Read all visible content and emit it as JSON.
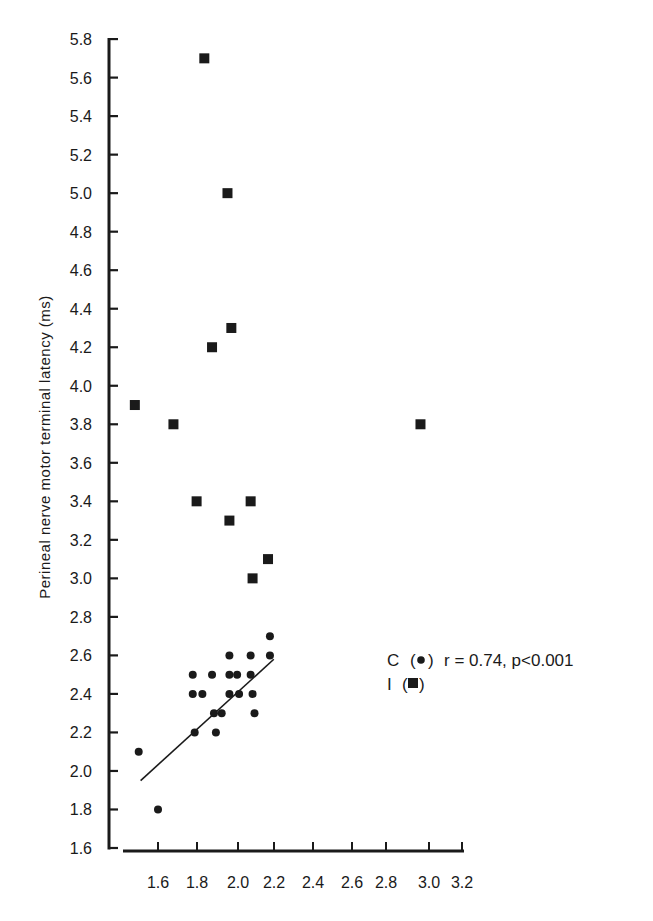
{
  "chart_data": {
    "type": "scatter",
    "title": "",
    "xlabel": "",
    "ylabel": "Perineal nerve motor terminal latency (ms)",
    "xlim": [
      1.5,
      3.2
    ],
    "ylim": [
      1.6,
      5.8
    ],
    "x_ticks": [
      "1.6",
      "1.8",
      "2.0",
      "2.2",
      "2.4",
      "2.6",
      "2.8",
      "3.0",
      "3.2"
    ],
    "y_ticks": [
      "1.6",
      "1.8",
      "2.0",
      "2.2",
      "2.4",
      "2.6",
      "2.8",
      "3.0",
      "3.2",
      "3.4",
      "3.6",
      "3.8",
      "4.0",
      "4.2",
      "4.4",
      "4.6",
      "4.8",
      "5.0",
      "5.2",
      "5.4",
      "5.6",
      "5.8"
    ],
    "grid": false,
    "series": [
      {
        "name": "C",
        "marker": "circle",
        "points": [
          [
            1.5,
            2.1
          ],
          [
            1.6,
            1.8
          ],
          [
            1.78,
            2.5
          ],
          [
            1.78,
            2.4
          ],
          [
            1.83,
            2.4
          ],
          [
            1.79,
            2.2
          ],
          [
            1.88,
            2.5
          ],
          [
            1.89,
            2.3
          ],
          [
            1.93,
            2.3
          ],
          [
            1.9,
            2.2
          ],
          [
            1.97,
            2.6
          ],
          [
            1.97,
            2.5
          ],
          [
            2.01,
            2.5
          ],
          [
            1.97,
            2.4
          ],
          [
            2.02,
            2.4
          ],
          [
            2.08,
            2.6
          ],
          [
            2.08,
            2.5
          ],
          [
            2.09,
            2.4
          ],
          [
            2.1,
            2.3
          ],
          [
            2.18,
            2.7
          ],
          [
            2.18,
            2.6
          ]
        ],
        "regression_line": {
          "x": [
            1.51,
            2.2
          ],
          "y": [
            1.95,
            2.58
          ]
        }
      },
      {
        "name": "I",
        "marker": "square",
        "points": [
          [
            1.84,
            5.7
          ],
          [
            1.96,
            5.0
          ],
          [
            1.98,
            4.3
          ],
          [
            1.88,
            4.2
          ],
          [
            1.48,
            3.9
          ],
          [
            1.68,
            3.8
          ],
          [
            2.96,
            3.8
          ],
          [
            1.8,
            3.4
          ],
          [
            2.08,
            3.4
          ],
          [
            1.97,
            3.3
          ],
          [
            2.17,
            3.1
          ],
          [
            2.09,
            3.0
          ]
        ]
      }
    ],
    "legend": {
      "position": "right-middle",
      "entries": [
        {
          "label": "C",
          "marker": "circle",
          "stat": "r = 0.74, p<0.001"
        },
        {
          "label": "I",
          "marker": "square",
          "stat": ""
        }
      ]
    },
    "annotations": [
      "r = 0.74, p<0.001"
    ]
  },
  "legend": {
    "c_label": "C",
    "c_paren_open": "(",
    "c_paren_close": ")",
    "c_stat": "r = 0.74, p<0.001",
    "i_label": "I",
    "i_paren_open": "(",
    "i_paren_close": ")"
  },
  "axes": {
    "ylabel": "Perineal nerve motor terminal latency (ms)"
  },
  "colors": {
    "ink": "#1a1a1a",
    "background": "#ffffff"
  }
}
